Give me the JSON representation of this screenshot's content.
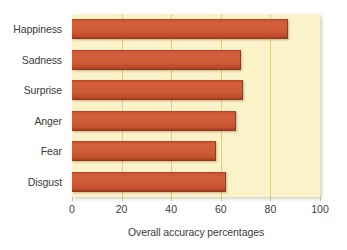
{
  "chart_data": {
    "type": "bar",
    "orientation": "horizontal",
    "title": "",
    "subtitle": "",
    "xlabel": "Overall accuracy percentages",
    "ylabel": "",
    "categories": [
      "Happiness",
      "Sadness",
      "Surprise",
      "Anger",
      "Fear",
      "Disgust"
    ],
    "values": [
      87,
      68,
      69,
      66,
      58,
      62
    ],
    "series": [
      {
        "name": "Overall accuracy percentages",
        "values": [
          87,
          68,
          69,
          66,
          58,
          62
        ]
      }
    ],
    "xlim": [
      0,
      100
    ],
    "xticks": [
      0,
      20,
      40,
      60,
      80,
      100
    ],
    "xtick_labels": [
      "0",
      "20",
      "40",
      "60",
      "80",
      "100"
    ],
    "grid": "vertical",
    "legend": "none",
    "annotations": [],
    "colors": {
      "bar": "#cf5a38",
      "bar_border": "#93391c",
      "plot_background": "#faf2c9",
      "gridline": "#e3c268",
      "page_background": "#ffffff",
      "text": "#3b3b3b"
    }
  }
}
